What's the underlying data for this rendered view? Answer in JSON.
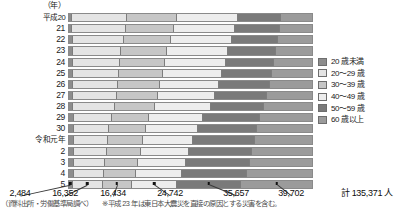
{
  "axis": {
    "unit_label": "（年）"
  },
  "chart_data": {
    "type": "bar",
    "subtype": "stacked-horizontal-100pct",
    "title": "",
    "xlabel": "",
    "ylabel": "（年）",
    "grid": false,
    "legend_position": "right",
    "xlim": [
      0,
      100
    ],
    "categories": [
      "平成20",
      "21",
      "22",
      "23",
      "24",
      "25",
      "26",
      "27",
      "28",
      "29",
      "30",
      "令和元年",
      "2",
      "3",
      "4",
      "5"
    ],
    "series": [
      {
        "name": "20歳未満",
        "color": "#8d8d8d",
        "values": [
          1.4,
          1.4,
          1.5,
          1.5,
          1.5,
          1.6,
          1.6,
          1.7,
          1.8,
          2.0,
          2.0,
          2.0,
          2.0,
          2.0,
          1.9,
          1.8
        ]
      },
      {
        "name": "20～29歳",
        "color": "#e4e4e4",
        "values": [
          22.5,
          22.0,
          21.0,
          20.0,
          19.5,
          19.0,
          18.5,
          18.0,
          17.0,
          15.5,
          14.5,
          14.0,
          13.5,
          13.0,
          12.5,
          12.1
        ]
      },
      {
        "name": "30～39歳",
        "color": "#c6c6c6",
        "values": [
          20.5,
          20.0,
          19.5,
          19.0,
          18.5,
          18.0,
          17.5,
          17.0,
          16.5,
          15.5,
          15.0,
          14.5,
          14.0,
          13.5,
          13.0,
          12.1
        ]
      },
      {
        "name": "40～49歳",
        "color": "#ededed",
        "values": [
          25.0,
          25.0,
          25.0,
          25.0,
          25.0,
          24.5,
          24.0,
          23.5,
          23.0,
          22.0,
          21.5,
          20.5,
          20.0,
          19.5,
          19.0,
          18.3
        ]
      },
      {
        "name": "50～59歳",
        "color": "#7a7a7a",
        "values": [
          18.0,
          18.5,
          19.0,
          19.5,
          20.0,
          20.5,
          21.0,
          21.5,
          22.0,
          23.5,
          24.5,
          25.5,
          26.0,
          26.5,
          27.0,
          26.3
        ]
      },
      {
        "name": "60歳以上",
        "color": "#9b9b9b",
        "values": [
          12.6,
          13.1,
          14.0,
          15.0,
          15.5,
          16.4,
          17.4,
          18.3,
          19.7,
          21.5,
          22.5,
          23.5,
          24.5,
          25.5,
          26.6,
          29.4
        ]
      }
    ],
    "value_labels": {
      "row": "5",
      "entries": [
        {
          "series": "20歳未満",
          "label": "2,484",
          "value": 2484
        },
        {
          "series": "20～29歳",
          "label": "16,352",
          "value": 16352
        },
        {
          "series": "30～39歳",
          "label": "16,434",
          "value": 16434
        },
        {
          "series": "40～49歳",
          "label": "24,742",
          "value": 24742
        },
        {
          "series": "50～59歳",
          "label": "35,657",
          "value": 35657
        },
        {
          "series": "60歳以上",
          "label": "39,702",
          "value": 39702
        }
      ],
      "total_label": "計 135,371 人",
      "total_value": 135371
    }
  },
  "legend": {
    "items": [
      {
        "label": "20 歳未満",
        "color": "#8d8d8d"
      },
      {
        "label": "20～29 歳",
        "color": "#e4e4e4"
      },
      {
        "label": "30～39 歳",
        "color": "#c6c6c6"
      },
      {
        "label": "40～49 歳",
        "color": "#ededed"
      },
      {
        "label": "50～59 歳",
        "color": "#7a7a7a"
      },
      {
        "label": "60 歳以上",
        "color": "#9b9b9b"
      }
    ]
  },
  "footnote": {
    "source": "（資料出所・労働基準局調べ）",
    "note": "※平成 23 年は東日本大震災を直接の原因とする災害を含む。"
  }
}
